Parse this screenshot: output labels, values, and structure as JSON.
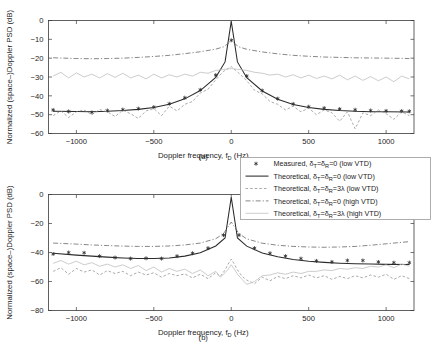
{
  "figure": {
    "panels": [
      {
        "caption": "(a)"
      },
      {
        "caption": "(b)"
      }
    ],
    "axis": {
      "xlabel_main": "Doppler frequency, f",
      "xlabel_sub": "D",
      "xlabel_unit": " (Hz)",
      "ylabel": "Normalized (space–)Doppler PSD (dB)"
    }
  },
  "legend": {
    "position": "lower-right",
    "entries": [
      {
        "key": "measured-low-vtd",
        "marker": "asterisk",
        "style": "marker",
        "text": "Measured, δ",
        "sub1": "T",
        "mid": "=δ",
        "sub2": "R",
        "tail": "=0 (low VTD)"
      },
      {
        "key": "theoretical-0-low-vtd",
        "marker": "line-solid",
        "style": "solid",
        "text": "Theoretical, δ",
        "sub1": "T",
        "mid": "=δ",
        "sub2": "R",
        "tail": "=0 (low VTD)"
      },
      {
        "key": "theoretical-3lambda-low-vtd",
        "marker": "line-dashed",
        "style": "dashed",
        "text": "Theoretical, δ",
        "sub1": "T",
        "mid": "=δ",
        "sub2": "R",
        "tail": "=3λ (low VTD)"
      },
      {
        "key": "theoretical-0-high-vtd",
        "marker": "line-dashdot",
        "style": "dashdot",
        "text": "Theoretical, δ",
        "sub1": "T",
        "mid": "=δ",
        "sub2": "R",
        "tail": "=0 (high VTD)"
      },
      {
        "key": "theoretical-3lambda-high-vtd",
        "marker": "line-light",
        "style": "light",
        "text": "Theoretical, δ",
        "sub1": "T",
        "mid": "=δ",
        "sub2": "R",
        "tail": "=3λ (high VTD)"
      }
    ]
  },
  "chart_data": [
    {
      "id": "panel-a",
      "type": "line",
      "title": "",
      "xlabel": "Doppler frequency, f_D (Hz)",
      "ylabel": "Normalized (space-)Doppler PSD (dB)",
      "xlim": [
        -1180,
        1180
      ],
      "ylim": [
        -60,
        0
      ],
      "xticks": [
        -1000,
        -500,
        0,
        500,
        1000
      ],
      "xticklabels": [
        "-1000",
        "-500",
        "0",
        "500",
        "1000"
      ],
      "yticks": [
        0,
        -10,
        -20,
        -30,
        -40,
        -50,
        -60
      ],
      "yticklabels": [
        "0",
        "-10",
        "-20",
        "-30",
        "-40",
        "-50",
        "-60"
      ],
      "grid": false,
      "legend_position": "outside lower right",
      "series": [
        {
          "name": "Measured, dT=dR=0 (low VTD)",
          "style": "asterisk-markers",
          "x": [
            -1150,
            -1050,
            -900,
            -800,
            -700,
            -600,
            -500,
            -400,
            -300,
            -200,
            -100,
            0,
            100,
            200,
            300,
            400,
            500,
            600,
            700,
            800,
            900,
            1000,
            1100,
            1150
          ],
          "y": [
            -47.5,
            -48.3,
            -48.8,
            -47.8,
            -47.3,
            -46.8,
            -46.0,
            -44.2,
            -41.0,
            -36.8,
            -29.0,
            -10.5,
            -29.5,
            -37.2,
            -41.5,
            -44.3,
            -45.8,
            -46.5,
            -47.0,
            -47.4,
            -47.8,
            -48.0,
            -48.1,
            -48.2
          ]
        },
        {
          "name": "Theoretical, dT=dR=0 (low VTD)",
          "style": "solid",
          "x": [
            -1150,
            -1000,
            -900,
            -800,
            -700,
            -600,
            -500,
            -400,
            -300,
            -200,
            -100,
            -40,
            0,
            40,
            100,
            200,
            300,
            400,
            500,
            600,
            700,
            800,
            900,
            1000,
            1150
          ],
          "y": [
            -48.2,
            -48.3,
            -48.4,
            -48.2,
            -47.8,
            -47.2,
            -46.2,
            -44.5,
            -41.6,
            -37.2,
            -30.2,
            -22.0,
            -0.5,
            -22.0,
            -30.4,
            -37.4,
            -41.8,
            -44.6,
            -46.2,
            -47.2,
            -47.8,
            -48.2,
            -48.4,
            -48.5,
            -48.6
          ]
        },
        {
          "name": "Theoretical, dT=dR=3lambda (low VTD)",
          "style": "dashed",
          "x": [
            -1150,
            -1100,
            -1050,
            -1000,
            -950,
            -900,
            -850,
            -800,
            -750,
            -700,
            -650,
            -600,
            -550,
            -500,
            -450,
            -400,
            -350,
            -300,
            -250,
            -200,
            -150,
            -100,
            -50,
            0,
            50,
            100,
            150,
            200,
            250,
            300,
            350,
            400,
            450,
            500,
            550,
            600,
            650,
            700,
            750,
            800,
            850,
            900,
            950,
            1000,
            1050,
            1100,
            1150
          ],
          "y": [
            -50.5,
            -48.0,
            -51.5,
            -48.5,
            -47.5,
            -50.0,
            -47.3,
            -48.5,
            -51.0,
            -47.6,
            -49.5,
            -52.0,
            -48.0,
            -46.8,
            -50.5,
            -45.5,
            -48.0,
            -44.5,
            -43.0,
            -38.5,
            -36.5,
            -31.5,
            -27.0,
            -24.5,
            -28.0,
            -32.0,
            -37.0,
            -39.0,
            -43.0,
            -44.5,
            -47.5,
            -45.5,
            -48.5,
            -46.5,
            -50.0,
            -47.5,
            -49.0,
            -53.5,
            -48.5,
            -57.5,
            -49.0,
            -50.5,
            -47.5,
            -49.5,
            -52.5,
            -48.5,
            -50.5
          ]
        },
        {
          "name": "Theoretical, dT=dR=0 (high VTD)",
          "style": "dashdot",
          "x": [
            -1150,
            -1000,
            -900,
            -800,
            -700,
            -600,
            -500,
            -400,
            -300,
            -200,
            -100,
            -50,
            0,
            50,
            100,
            200,
            300,
            400,
            500,
            600,
            700,
            800,
            900,
            1000,
            1100,
            1150
          ],
          "y": [
            -19.8,
            -20.2,
            -20.3,
            -20.2,
            -20.0,
            -19.6,
            -19.1,
            -18.5,
            -17.6,
            -16.6,
            -15.2,
            -14.0,
            -11.0,
            -14.0,
            -15.3,
            -16.7,
            -17.7,
            -18.5,
            -19.0,
            -19.4,
            -19.6,
            -19.8,
            -19.9,
            -20.0,
            -20.1,
            -20.2
          ]
        },
        {
          "name": "Theoretical, dT=dR=3lambda (high VTD)",
          "style": "light",
          "x": [
            -1150,
            -1100,
            -1050,
            -1000,
            -950,
            -900,
            -850,
            -800,
            -750,
            -700,
            -650,
            -600,
            -550,
            -500,
            -450,
            -400,
            -350,
            -300,
            -250,
            -200,
            -150,
            -100,
            -50,
            0,
            50,
            100,
            150,
            200,
            250,
            300,
            350,
            400,
            450,
            500,
            550,
            600,
            650,
            700,
            750,
            800,
            850,
            900,
            950,
            1000,
            1050,
            1100,
            1150
          ],
          "y": [
            -29.5,
            -27.5,
            -30.5,
            -27.8,
            -30.0,
            -28.5,
            -30.5,
            -28.2,
            -30.2,
            -28.0,
            -30.5,
            -29.0,
            -31.0,
            -28.5,
            -30.5,
            -28.8,
            -30.0,
            -28.5,
            -29.5,
            -27.5,
            -28.0,
            -26.5,
            -26.0,
            -25.5,
            -26.0,
            -26.5,
            -27.5,
            -28.0,
            -29.0,
            -28.5,
            -30.0,
            -28.8,
            -30.5,
            -29.0,
            -30.8,
            -29.5,
            -31.0,
            -29.0,
            -31.5,
            -29.5,
            -31.8,
            -29.8,
            -32.0,
            -30.0,
            -32.5,
            -29.5,
            -31.0
          ]
        }
      ]
    },
    {
      "id": "panel-b",
      "type": "line",
      "title": "",
      "xlabel": "Doppler frequency, f_D (Hz)",
      "ylabel": "Normalized (space-)Doppler PSD (dB)",
      "xlim": [
        -1180,
        1180
      ],
      "ylim": [
        -80,
        0
      ],
      "xticks": [
        -1000,
        -500,
        0,
        500,
        1000
      ],
      "xticklabels": [
        "-1000",
        "-500",
        "0",
        "500",
        "1000"
      ],
      "yticks": [
        0,
        -20,
        -40,
        -60,
        -80
      ],
      "yticklabels": [
        "0",
        "-20",
        "-40",
        "-60",
        "-80"
      ],
      "grid": false,
      "legend_position": "outside upper right",
      "series": [
        {
          "name": "Measured, dT=dR=0 (low VTD)",
          "style": "asterisk-markers",
          "x": [
            -1150,
            -1050,
            -950,
            -850,
            -750,
            -650,
            -550,
            -450,
            -350,
            -250,
            -150,
            -50,
            50,
            150,
            250,
            350,
            450,
            550,
            650,
            750,
            850,
            950,
            1050,
            1150
          ],
          "y": [
            -41.0,
            -40.0,
            -40.2,
            -42.5,
            -43.5,
            -44.2,
            -44.0,
            -44.2,
            -42.5,
            -40.5,
            -37.0,
            -28.0,
            -28.0,
            -37.0,
            -40.5,
            -42.5,
            -44.2,
            -45.8,
            -46.5,
            -45.5,
            -45.5,
            -46.5,
            -47.0,
            -47.0
          ]
        },
        {
          "name": "Theoretical, dT=dR=0 (low VTD)",
          "style": "solid",
          "x": [
            -1150,
            -1000,
            -900,
            -800,
            -700,
            -600,
            -500,
            -400,
            -300,
            -200,
            -100,
            -40,
            0,
            40,
            100,
            200,
            300,
            400,
            500,
            600,
            700,
            800,
            900,
            1000,
            1150
          ],
          "y": [
            -40.5,
            -41.8,
            -42.5,
            -43.2,
            -43.8,
            -44.2,
            -44.2,
            -43.8,
            -42.5,
            -40.2,
            -35.5,
            -30.0,
            -2.0,
            -30.0,
            -35.6,
            -40.4,
            -43.0,
            -44.8,
            -46.0,
            -46.8,
            -47.4,
            -47.8,
            -48.0,
            -48.2,
            -48.3
          ]
        },
        {
          "name": "Theoretical, dT=dR=3lambda (low VTD)",
          "style": "dashed",
          "x": [
            -1150,
            -1100,
            -1050,
            -1000,
            -950,
            -900,
            -850,
            -800,
            -750,
            -700,
            -650,
            -600,
            -550,
            -500,
            -450,
            -400,
            -350,
            -300,
            -250,
            -200,
            -150,
            -100,
            -70,
            -40,
            -20,
            0,
            20,
            40,
            70,
            100,
            150,
            200,
            250,
            300,
            350,
            400,
            450,
            500,
            550,
            600,
            650,
            700,
            750,
            800,
            850,
            900,
            950,
            1000,
            1050,
            1100,
            1150
          ],
          "y": [
            -53.0,
            -50.5,
            -55.0,
            -51.0,
            -53.5,
            -52.0,
            -55.5,
            -52.5,
            -54.5,
            -53.0,
            -56.0,
            -53.5,
            -55.5,
            -54.0,
            -57.0,
            -54.5,
            -56.0,
            -54.8,
            -57.5,
            -55.0,
            -58.0,
            -54.0,
            -56.5,
            -52.0,
            -48.0,
            -44.5,
            -48.0,
            -52.0,
            -56.5,
            -59.0,
            -61.5,
            -57.0,
            -59.5,
            -56.5,
            -58.0,
            -56.0,
            -57.5,
            -55.5,
            -57.5,
            -56.0,
            -58.5,
            -56.5,
            -58.0,
            -56.0,
            -57.5,
            -55.5,
            -57.0,
            -55.0,
            -58.5,
            -56.0,
            -58.0
          ]
        },
        {
          "name": "Theoretical, dT=dR=0 (high VTD)",
          "style": "dashdot",
          "x": [
            -1150,
            -1000,
            -900,
            -800,
            -700,
            -600,
            -500,
            -400,
            -300,
            -200,
            -100,
            -50,
            0,
            50,
            100,
            200,
            300,
            400,
            500,
            600,
            700,
            800,
            900,
            1000,
            1100,
            1150
          ],
          "y": [
            -33.5,
            -34.2,
            -34.8,
            -35.2,
            -35.6,
            -35.8,
            -35.8,
            -35.5,
            -34.8,
            -33.5,
            -30.5,
            -27.0,
            -19.0,
            -27.0,
            -30.6,
            -33.6,
            -35.0,
            -35.8,
            -36.2,
            -36.4,
            -36.2,
            -35.8,
            -35.0,
            -34.0,
            -33.0,
            -32.5
          ]
        },
        {
          "name": "Theoretical, dT=dR=3lambda (high VTD)",
          "style": "light",
          "x": [
            -1150,
            -1100,
            -1050,
            -1000,
            -950,
            -900,
            -850,
            -800,
            -750,
            -700,
            -650,
            -600,
            -550,
            -500,
            -450,
            -400,
            -350,
            -300,
            -250,
            -200,
            -150,
            -100,
            -70,
            -40,
            -20,
            0,
            20,
            40,
            70,
            100,
            150,
            200,
            250,
            300,
            350,
            400,
            450,
            500,
            550,
            600,
            650,
            700,
            750,
            800,
            850,
            900,
            950,
            1000,
            1050,
            1100,
            1150
          ],
          "y": [
            -47.5,
            -45.5,
            -48.0,
            -46.0,
            -48.5,
            -47.0,
            -49.5,
            -48.0,
            -50.0,
            -48.5,
            -51.0,
            -49.0,
            -52.5,
            -50.0,
            -53.5,
            -51.0,
            -53.0,
            -51.5,
            -54.5,
            -52.0,
            -56.0,
            -53.0,
            -57.0,
            -54.0,
            -51.5,
            -48.5,
            -51.5,
            -55.0,
            -58.5,
            -62.0,
            -60.0,
            -56.0,
            -55.5,
            -54.0,
            -55.0,
            -53.5,
            -54.5,
            -53.0,
            -53.0,
            -52.0,
            -52.5,
            -51.0,
            -51.5,
            -50.5,
            -51.0,
            -49.5,
            -50.0,
            -48.5,
            -50.5,
            -48.0,
            -49.5
          ]
        }
      ]
    }
  ]
}
